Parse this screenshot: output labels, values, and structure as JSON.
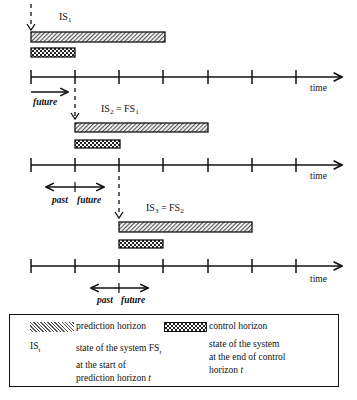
{
  "diagram": {
    "axis_label": "time",
    "colors": {
      "line": "#111111",
      "hatch": "#555555",
      "background": "#ffffff"
    },
    "steps": [
      {
        "state_label_main": "IS",
        "state_label_sub": "1",
        "state_label_rest": "",
        "labels": [
          "future"
        ]
      },
      {
        "state_label_main": "IS",
        "state_label_sub": "2",
        "state_label_rest": " = FS",
        "state_label_sub2": "1",
        "labels": [
          "past",
          "future"
        ]
      },
      {
        "state_label_main": "IS",
        "state_label_sub": "3",
        "state_label_rest": " = FS",
        "state_label_sub2": "2",
        "labels": [
          "past",
          "future"
        ]
      }
    ]
  },
  "legend": {
    "prediction_label": "prediction horizon",
    "control_label": "control horizon",
    "is_main": "IS",
    "is_sub": "t",
    "is_desc_line1": "state of the system FS",
    "is_desc_sub": "t",
    "is_desc_line2": "at the start of",
    "is_desc_line3": "prediction horizon ",
    "is_desc_t": "t",
    "fs_desc_line1": "state of the system",
    "fs_desc_line2": "at the end of control",
    "fs_desc_line3": "horizon ",
    "fs_desc_t": "t"
  }
}
